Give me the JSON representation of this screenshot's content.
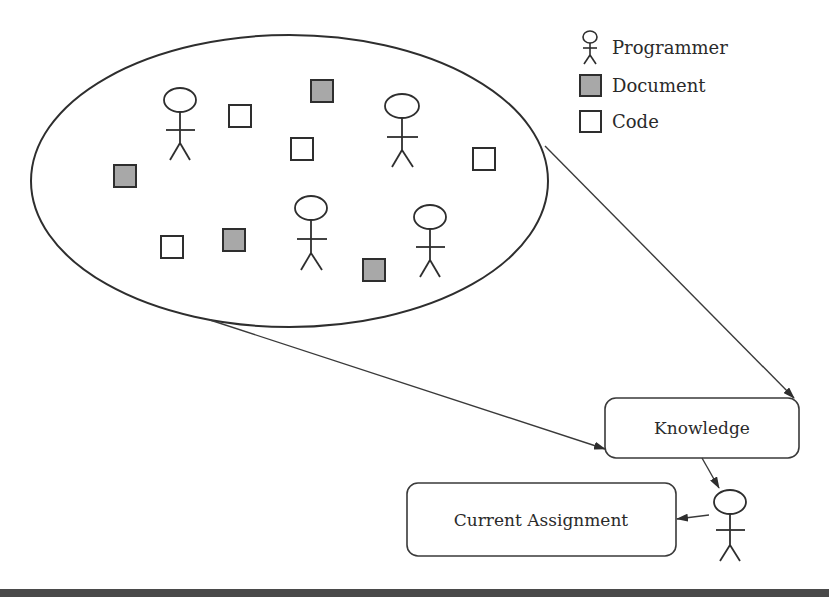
{
  "legend": {
    "items": [
      {
        "icon": "stick-figure-icon",
        "label": "Programmer"
      },
      {
        "icon": "filled-square-icon",
        "label": "Document",
        "color": "#a8a8a8"
      },
      {
        "icon": "empty-square-icon",
        "label": "Code",
        "color": "#ffffff"
      }
    ]
  },
  "cluster": {
    "shape": "ellipse",
    "programmers": 4,
    "documents": 4,
    "code_items": 4
  },
  "nodes": {
    "knowledge": {
      "label": "Knowledge"
    },
    "current_assignment": {
      "label": "Current Assignment"
    },
    "programmer": {
      "icon": "stick-figure-icon"
    }
  },
  "edges": [
    {
      "from": "cluster",
      "to": "knowledge"
    },
    {
      "from": "cluster",
      "to": "knowledge"
    },
    {
      "from": "knowledge",
      "to": "programmer"
    },
    {
      "from": "programmer",
      "to": "current_assignment"
    }
  ],
  "colors": {
    "document_fill": "#a8a8a8",
    "stroke": "#2e2e2e",
    "bottom_bar": "#4a4a4a"
  }
}
